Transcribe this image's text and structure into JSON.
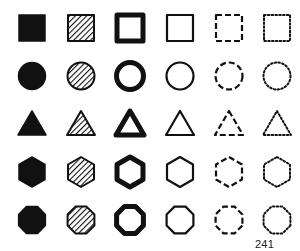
{
  "figure": {
    "page_number": "241",
    "ink_color": "#111111",
    "background": "#ffffff",
    "rows": [
      {
        "shape": "square",
        "cy": 28
      },
      {
        "shape": "circle",
        "cy": 76
      },
      {
        "shape": "triangle",
        "cy": 124
      },
      {
        "shape": "hexagon",
        "cy": 172
      },
      {
        "shape": "octagon",
        "cy": 220
      }
    ],
    "columns": [
      {
        "style": "solid",
        "cx": 32
      },
      {
        "style": "hatched",
        "cx": 81
      },
      {
        "style": "thick-outline",
        "cx": 130
      },
      {
        "style": "thin-outline",
        "cx": 180
      },
      {
        "style": "dashed",
        "cx": 229
      },
      {
        "style": "dotted",
        "cx": 277
      }
    ]
  }
}
